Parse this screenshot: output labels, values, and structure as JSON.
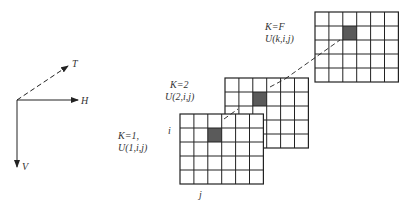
{
  "axes": {
    "t_label": "T",
    "h_label": "H",
    "v_label": "V"
  },
  "grid": {
    "rows": 5,
    "cols": 6,
    "highlight_row": 1,
    "highlight_col": 2
  },
  "layers": [
    {
      "name": "layer-1",
      "k_label": "K=1,",
      "u_label": "U(1,i,j)"
    },
    {
      "name": "layer-2",
      "k_label": "K=2",
      "u_label": "U(2,i,j)"
    },
    {
      "name": "layer-F",
      "k_label": "K=F",
      "u_label": "U(k,i,j)"
    }
  ],
  "index_labels": {
    "row": "i",
    "col": "j"
  },
  "colors": {
    "line": "#222222",
    "highlight": "#5a5a5a"
  }
}
